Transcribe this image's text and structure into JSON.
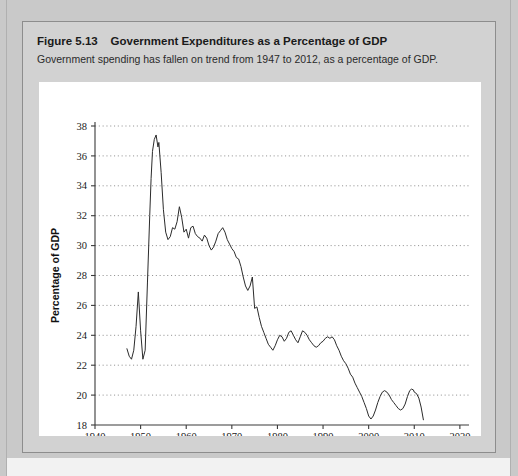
{
  "figure": {
    "number_label": "Figure 5.13",
    "title": "Government Expenditures as a Percentage of GDP",
    "subtitle": "Government spending has fallen on trend from 1947 to 2012, as a percentage of GDP."
  },
  "chart_data": {
    "type": "line",
    "title": "Government Expenditures as a Percentage of GDP",
    "subtitle": "Government spending has fallen on trend from 1947 to 2012, as a percentage of GDP.",
    "xlabel": "Year",
    "ylabel": "Percentage of GDP",
    "xlim": [
      1940,
      2022
    ],
    "ylim": [
      18,
      38
    ],
    "xticks": [
      1940,
      1950,
      1960,
      1970,
      1980,
      1990,
      2000,
      2010,
      2020
    ],
    "yticks": [
      18,
      20,
      22,
      24,
      26,
      28,
      30,
      32,
      34,
      36,
      38
    ],
    "grid": "horizontal-dotted",
    "legend": "none",
    "line_color": "#2b2b2b",
    "series": [
      {
        "name": "Government Expenditures as a Percentage of GDP",
        "x": [
          1947,
          1947.5,
          1948,
          1948.5,
          1949,
          1949.5,
          1950,
          1950.5,
          1951,
          1951.5,
          1952,
          1952.3,
          1952.6,
          1953,
          1953.4,
          1953.8,
          1954,
          1954.5,
          1955,
          1955.5,
          1956,
          1956.5,
          1957,
          1957.5,
          1958,
          1958.5,
          1959,
          1959.5,
          1960,
          1960.5,
          1961,
          1961.5,
          1962,
          1962.5,
          1963,
          1963.5,
          1964,
          1964.5,
          1965,
          1965.5,
          1966,
          1966.5,
          1967,
          1967.5,
          1968,
          1968.5,
          1969,
          1969.5,
          1970,
          1970.5,
          1971,
          1971.5,
          1972,
          1972.5,
          1973,
          1973.5,
          1974,
          1974.5,
          1975,
          1975.5,
          1976,
          1976.5,
          1977,
          1977.5,
          1978,
          1978.5,
          1979,
          1979.5,
          1980,
          1980.5,
          1981,
          1981.5,
          1982,
          1982.5,
          1983,
          1983.5,
          1984,
          1984.5,
          1985,
          1985.5,
          1986,
          1986.5,
          1987,
          1987.5,
          1988,
          1988.5,
          1989,
          1989.5,
          1990,
          1990.5,
          1991,
          1991.5,
          1992,
          1992.5,
          1993,
          1993.5,
          1994,
          1994.5,
          1995,
          1995.5,
          1996,
          1996.5,
          1997,
          1997.5,
          1998,
          1998.5,
          1999,
          1999.5,
          2000,
          2000.5,
          2001,
          2001.5,
          2002,
          2002.5,
          2003,
          2003.5,
          2004,
          2004.5,
          2005,
          2005.5,
          2006,
          2006.5,
          2007,
          2007.5,
          2008,
          2008.5,
          2009,
          2009.4,
          2009.8,
          2010,
          2010.5,
          2011,
          2011.5,
          2012
        ],
        "y": [
          23.1,
          22.6,
          22.4,
          23.0,
          24.6,
          26.9,
          24.3,
          22.4,
          23.0,
          27.5,
          32.0,
          34.5,
          36.3,
          37.1,
          37.4,
          36.6,
          36.9,
          34.9,
          32.4,
          30.9,
          30.4,
          30.6,
          31.2,
          31.1,
          31.6,
          32.6,
          31.9,
          30.9,
          31.1,
          30.5,
          31.2,
          31.3,
          30.8,
          30.6,
          30.5,
          30.3,
          30.7,
          30.5,
          30.0,
          29.7,
          29.9,
          30.3,
          30.8,
          31.0,
          31.2,
          30.9,
          30.4,
          30.1,
          29.8,
          29.6,
          29.2,
          29.1,
          28.6,
          27.9,
          27.3,
          27.0,
          27.3,
          27.9,
          25.8,
          25.9,
          25.2,
          24.6,
          24.2,
          23.8,
          23.4,
          23.2,
          23.0,
          23.3,
          23.7,
          24.0,
          23.9,
          23.6,
          23.8,
          24.2,
          24.3,
          24.0,
          23.7,
          23.5,
          23.9,
          24.3,
          24.2,
          24.0,
          23.7,
          23.5,
          23.3,
          23.2,
          23.3,
          23.5,
          23.6,
          23.8,
          23.9,
          23.8,
          23.9,
          23.7,
          23.3,
          23.0,
          22.6,
          22.3,
          22.1,
          21.8,
          21.4,
          21.2,
          20.8,
          20.5,
          20.2,
          19.9,
          19.5,
          19.1,
          18.6,
          18.4,
          18.6,
          19.0,
          19.5,
          19.9,
          20.2,
          20.3,
          20.2,
          20.0,
          19.7,
          19.5,
          19.3,
          19.1,
          19.0,
          19.1,
          19.4,
          19.9,
          20.3,
          20.4,
          20.35,
          20.2,
          20.1,
          19.8,
          19.2,
          18.35
        ]
      }
    ]
  }
}
